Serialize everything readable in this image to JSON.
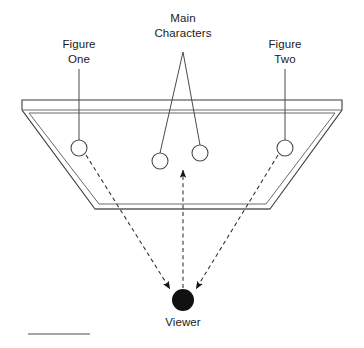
{
  "diagram": {
    "type": "stage-blocking-diagram",
    "background_color": "#ffffff",
    "line_color": "#3a3a3a",
    "viewer_color": "#111111",
    "labels": {
      "main_characters": {
        "line1": "Main",
        "line2": "Characters"
      },
      "figure_one": {
        "line1": "Figure",
        "line2": "One"
      },
      "figure_two": {
        "line1": "Figure",
        "line2": "Two"
      },
      "viewer": "Viewer"
    },
    "actors": [
      {
        "id": "figure-one",
        "label": "Figure One",
        "cx": 79,
        "cy": 148,
        "r": 8,
        "filled": false
      },
      {
        "id": "main-character-left",
        "label": "Main Character Left",
        "cx": 160,
        "cy": 161,
        "r": 8,
        "filled": false
      },
      {
        "id": "main-character-right",
        "label": "Main Character Right",
        "cx": 200,
        "cy": 153,
        "r": 8,
        "filled": false
      },
      {
        "id": "figure-two",
        "label": "Figure Two",
        "cx": 285,
        "cy": 148,
        "r": 8,
        "filled": false
      }
    ],
    "viewer": {
      "cx": 183,
      "cy": 300,
      "r": 11,
      "filled": true
    },
    "stage": {
      "shape": "trapezoid",
      "top_left_x": 22,
      "top_right_x": 342,
      "top_y": 100,
      "bottom_left_x": 95,
      "bottom_right_x": 270,
      "bottom_y": 209,
      "double_rule": true
    },
    "sight_lines": [
      {
        "id": "sightline-figure-one",
        "from": "figure-one",
        "to": "viewer",
        "style": "dashed",
        "arrow": "to-viewer"
      },
      {
        "id": "sightline-center",
        "from": "viewer",
        "to": "stage-center",
        "style": "dashed",
        "arrow": "to-stage"
      },
      {
        "id": "sightline-figure-two",
        "from": "figure-two",
        "to": "viewer",
        "style": "dashed",
        "arrow": "to-viewer"
      }
    ],
    "leader_lines": [
      {
        "id": "leader-figure-one",
        "from_label": "Figure One",
        "to_actor": "figure-one"
      },
      {
        "id": "leader-figure-two",
        "from_label": "Figure Two",
        "to_actor": "figure-two"
      },
      {
        "id": "leader-main-left",
        "from_label": "Main Characters",
        "to_actor": "main-character-left"
      },
      {
        "id": "leader-main-right",
        "from_label": "Main Characters",
        "to_actor": "main-character-right"
      }
    ],
    "footer_rule": {
      "x1": 28,
      "x2": 90,
      "y": 334
    }
  }
}
